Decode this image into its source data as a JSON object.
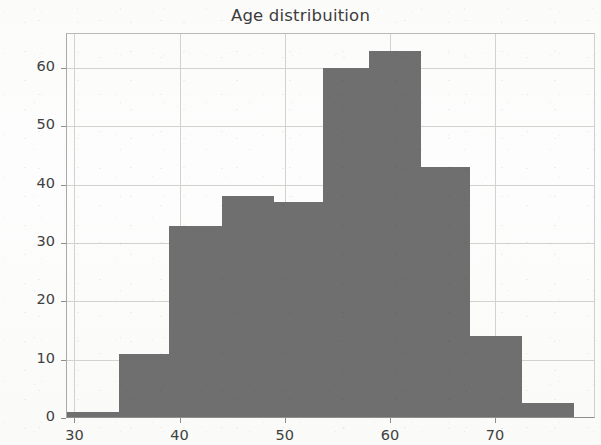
{
  "chart_data": {
    "type": "bar",
    "title": "Age distribuition",
    "subtitle": "",
    "xlabel": "",
    "ylabel": "",
    "xlim": [
      29.2,
      79.5
    ],
    "ylim": [
      0,
      66
    ],
    "grid": true,
    "legend": null,
    "bar_color": "#6f6f6f",
    "categories": [
      "29.2-34.2",
      "34.2-39.0",
      "39.0-44.0",
      "44.0-49.0",
      "49.0-53.6",
      "53.6-58.0",
      "58.0-63.0",
      "63.0-67.6",
      "67.6-72.6",
      "72.6-77.5"
    ],
    "bin_edges": [
      29.2,
      34.2,
      39.0,
      44.0,
      49.0,
      53.6,
      58.0,
      63.0,
      67.6,
      72.6,
      77.5
    ],
    "values": [
      1,
      11,
      33,
      38,
      37,
      60,
      63,
      43,
      14,
      2.5
    ],
    "xticks": [
      30,
      40,
      50,
      60,
      70
    ],
    "xtick_labels": [
      "30",
      "40",
      "50",
      "60",
      "70"
    ],
    "yticks": [
      0,
      10,
      20,
      30,
      40,
      50,
      60
    ],
    "ytick_labels": [
      "0",
      "10",
      "20",
      "30",
      "40",
      "50",
      "60"
    ]
  }
}
